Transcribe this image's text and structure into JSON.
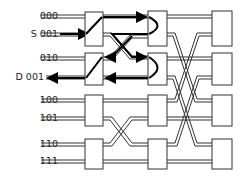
{
  "diagram": {
    "type": "omega-network-routing",
    "inputs": [
      {
        "label": "000",
        "y": 16
      },
      {
        "label": "S 001",
        "y": 34
      },
      {
        "label": "010",
        "y": 58
      },
      {
        "label": "D 001",
        "y": 77
      },
      {
        "label": "100",
        "y": 100
      },
      {
        "label": "101",
        "y": 118
      },
      {
        "label": "110",
        "y": 144
      },
      {
        "label": "111",
        "y": 161
      }
    ],
    "stages": 3,
    "switches_per_stage": 4,
    "source": "S 001",
    "destination": "D 001"
  }
}
